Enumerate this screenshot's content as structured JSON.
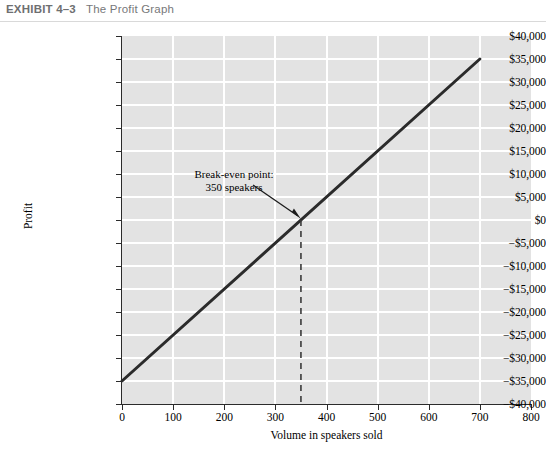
{
  "exhibit": {
    "number": "EXHIBIT 4–3",
    "title": "The Profit Graph"
  },
  "chart_data": {
    "type": "line",
    "title": "The Profit Graph",
    "xlabel": "Volume in speakers sold",
    "ylabel": "Profit",
    "xlim": [
      0,
      800
    ],
    "ylim": [
      -40000,
      40000
    ],
    "grid": true,
    "legend": "none",
    "x_ticks": [
      0,
      100,
      200,
      300,
      400,
      500,
      600,
      700,
      800
    ],
    "x_tick_labels": [
      "0",
      "100",
      "200",
      "300",
      "400",
      "500",
      "600",
      "700",
      "800"
    ],
    "y_ticks": [
      40000,
      35000,
      30000,
      25000,
      20000,
      15000,
      10000,
      5000,
      0,
      -5000,
      -10000,
      -15000,
      -20000,
      -25000,
      -30000,
      -35000,
      -40000
    ],
    "y_tick_labels": [
      "$40,000",
      "$35,000",
      "$30,000",
      "$25,000",
      "$20,000",
      "$15,000",
      "$10,000",
      "$5,000",
      "$0",
      "−$5,000",
      "−$10,000",
      "−$15,000",
      "−$20,000",
      "−$25,000",
      "−$30,000",
      "−$35,000",
      "−$40,000"
    ],
    "series": [
      {
        "name": "Profit",
        "x": [
          0,
          700
        ],
        "y": [
          -35000,
          35000
        ],
        "color": "#2b2b2b",
        "line_width": 3
      }
    ],
    "annotations": [
      {
        "name": "break-even",
        "text_line1": "Break-even point:",
        "text_line2": "350 speakers",
        "point_x": 350,
        "point_y": 0,
        "marker": "arrow + dashed vertical drop line"
      }
    ],
    "plot_background": "#e3e3e3",
    "gridline_color": "#ffffff"
  }
}
